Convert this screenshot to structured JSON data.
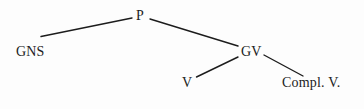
{
  "figure": {
    "type": "syntax-tree",
    "background_color": "#fdfdfd",
    "line_color": "#1c1c1c",
    "text_color": "#1c1c1c"
  },
  "nodes": {
    "root": {
      "label": "P"
    },
    "subject": {
      "label": "GNS"
    },
    "predicate": {
      "label": "GV"
    },
    "verb": {
      "label": "V"
    },
    "complement": {
      "label": "Compl. V."
    }
  },
  "edges": [
    {
      "from": "P",
      "to": "GNS"
    },
    {
      "from": "P",
      "to": "GV"
    },
    {
      "from": "GV",
      "to": "V"
    },
    {
      "from": "GV",
      "to": "Compl. V."
    }
  ]
}
